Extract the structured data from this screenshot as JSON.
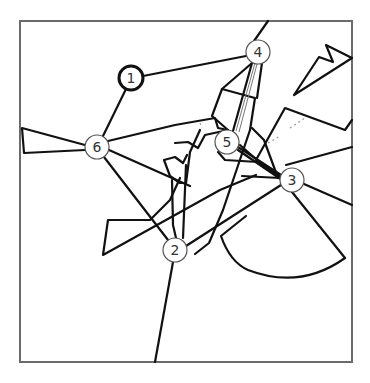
{
  "diagram": {
    "type": "graph-with-polygonal-obstacles",
    "frame": {
      "x": 20,
      "y": 21,
      "width": 332,
      "height": 341
    },
    "nodes": [
      {
        "id": "1",
        "label": "1",
        "x": 131,
        "y": 78,
        "highlighted": true
      },
      {
        "id": "2",
        "label": "2",
        "x": 175,
        "y": 250,
        "highlighted": false
      },
      {
        "id": "3",
        "label": "3",
        "x": 292,
        "y": 180,
        "highlighted": false
      },
      {
        "id": "4",
        "label": "4",
        "x": 258,
        "y": 52,
        "highlighted": false
      },
      {
        "id": "5",
        "label": "5",
        "x": 227,
        "y": 142,
        "highlighted": false
      },
      {
        "id": "6",
        "label": "6",
        "x": 97,
        "y": 147,
        "highlighted": false
      }
    ],
    "edges": [
      {
        "from": "1",
        "to": "4"
      },
      {
        "from": "1",
        "to": "6"
      },
      {
        "from": "6",
        "to": "5"
      },
      {
        "from": "6",
        "to": "2"
      },
      {
        "from": "6",
        "to": "3"
      },
      {
        "from": "4",
        "to": "5"
      },
      {
        "from": "5",
        "to": "3"
      },
      {
        "from": "2",
        "to": "3"
      },
      {
        "from": "2",
        "to": "5"
      }
    ],
    "colors": {
      "line": "#111111",
      "frame": "#6b6b6b",
      "node_stroke": "#555555",
      "background": "#ffffff"
    }
  }
}
